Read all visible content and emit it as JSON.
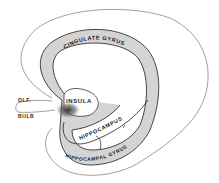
{
  "diagram": {
    "labels": {
      "cingulate": "CINGULATE GYRUS",
      "insula": "INSULA",
      "olf": "OLF.",
      "bulb": "BULB",
      "hippocampus": "HIPPOCAMPUS",
      "hippocampal": "HIPPOCAMPAL GYRUS"
    },
    "colors": {
      "outline": "#555555",
      "band_fill": "#d0d0d0",
      "dark_shade": "#3a3a3a",
      "background": "#ffffff"
    }
  }
}
